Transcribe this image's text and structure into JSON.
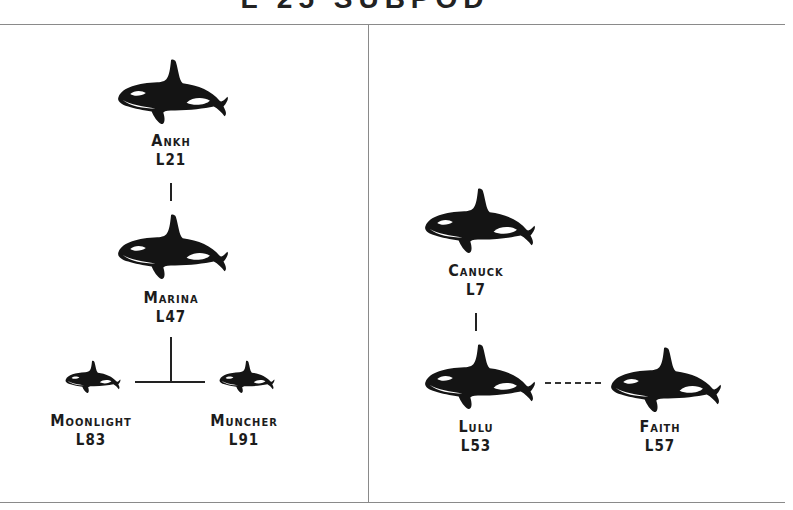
{
  "title": "L 25 SUBPOD",
  "panels": [
    {
      "name": "left-family",
      "whales": [
        {
          "name": "Ankh",
          "id": "L21"
        },
        {
          "name": "Marina",
          "id": "L47"
        },
        {
          "name": "Moonlight",
          "id": "L83"
        },
        {
          "name": "Muncher",
          "id": "L91"
        }
      ]
    },
    {
      "name": "right-family",
      "whales": [
        {
          "name": "Canuck",
          "id": "L7"
        },
        {
          "name": "Lulu",
          "id": "L53"
        },
        {
          "name": "Faith",
          "id": "L57"
        }
      ]
    }
  ],
  "icons": {
    "whale": "orca-icon"
  },
  "colors": {
    "ink": "#1c1c1c",
    "rule": "#8a8a8a",
    "background": "#ffffff"
  }
}
